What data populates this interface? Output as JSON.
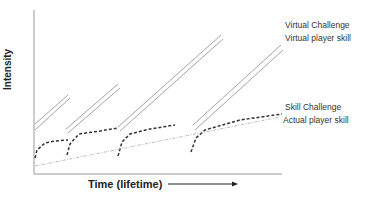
{
  "chart_data": {
    "type": "line",
    "title": "",
    "xlabel": "Time (lifetime)",
    "ylabel": "Intensity",
    "axes": {
      "grid": false,
      "x_arrow": true
    },
    "legend_position": "right-inline",
    "series": [
      {
        "name": "Virtual Challenge",
        "style": "solid-thin",
        "color": "#9a9a9a",
        "segments": [
          [
            [
              35,
              124
            ],
            [
              68,
              95
            ]
          ],
          [
            [
              66,
              129
            ],
            [
              118,
              84
            ]
          ],
          [
            [
              118,
              127
            ],
            [
              221,
              35
            ]
          ],
          [
            [
              193,
              125
            ],
            [
              281,
              45
            ]
          ]
        ]
      },
      {
        "name": "Virtual player skill",
        "style": "solid-thin",
        "color": "#9a9a9a",
        "segments": [
          [
            [
              35,
              130
            ],
            [
              70,
              98
            ]
          ],
          [
            [
              68,
              133
            ],
            [
              120,
              88
            ]
          ],
          [
            [
              120,
              131
            ],
            [
              223,
              39
            ]
          ],
          [
            [
              195,
              130
            ],
            [
              283,
              50
            ]
          ]
        ]
      },
      {
        "name": "Skill Challenge",
        "style": "dashed-bold",
        "color": "#333333",
        "segments": [
          [
            [
              35,
              158
            ],
            [
              37,
              150
            ],
            [
              45,
              143
            ],
            [
              55,
              141
            ],
            [
              68,
              140
            ]
          ],
          [
            [
              67,
              155
            ],
            [
              70,
              144
            ],
            [
              79,
              134
            ],
            [
              100,
              131
            ],
            [
              118,
              128
            ]
          ],
          [
            [
              118,
              156
            ],
            [
              122,
              142
            ],
            [
              130,
              134
            ],
            [
              150,
              129
            ],
            [
              175,
              125
            ]
          ],
          [
            [
              191,
              152
            ],
            [
              196,
              138
            ],
            [
              205,
              130
            ],
            [
              240,
              120
            ],
            [
              282,
              114
            ]
          ]
        ]
      },
      {
        "name": "Actual player skill",
        "style": "dashdot-thin",
        "color": "#aaaaaa",
        "segments": [
          [
            [
              35,
              166
            ],
            [
              280,
              117
            ]
          ]
        ]
      }
    ],
    "annotations": {
      "labels": [
        {
          "text": "Virtual Challenge",
          "x": 285,
          "y": 25
        },
        {
          "text": "Virtual player skill",
          "x": 285,
          "y": 38
        },
        {
          "text": "Skill Challenge",
          "x": 285,
          "y": 107
        },
        {
          "text": "Actual player skill",
          "x": 283,
          "y": 120
        }
      ]
    }
  },
  "labels": {
    "y_axis": "Intensity",
    "x_axis": "Time (lifetime)",
    "virtual_challenge": "Virtual Challenge",
    "virtual_player_skill": "Virtual player skill",
    "skill_challenge": "Skill Challenge",
    "actual_player_skill": "Actual player skill"
  }
}
